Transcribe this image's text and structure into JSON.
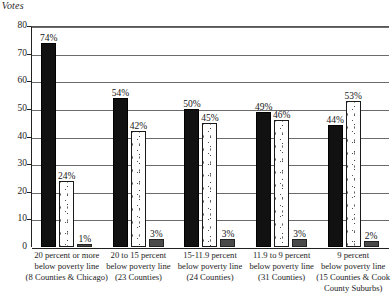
{
  "chart_data": {
    "type": "bar",
    "title": "f Votes",
    "xlabel": "",
    "ylabel": "f Votes",
    "ylim": [
      0,
      80
    ],
    "yticks": [
      0,
      10,
      20,
      30,
      40,
      50,
      60,
      70,
      80
    ],
    "grid": true,
    "legend": "none",
    "categories": [
      "20 percent or more below poverty line (8 Counties & Chicago)",
      "20 to 15 percent below poverty line (23 Counties)",
      "15-11.9 percent below poverty line (24 Counties)",
      "11.9 to 9 percent below poverty line (31 Counties)",
      "9 percent below poverty line (15 Counties & Cook County Suburbs)"
    ],
    "category_lines": [
      [
        "20 percent or more",
        "below poverty line",
        "(8 Counties & Chicago)"
      ],
      [
        "20 to 15 percent",
        "below poverty line",
        "(23 Counties)"
      ],
      [
        "15-11.9 percent",
        "below poverty line",
        "(24 Counties)"
      ],
      [
        "11.9 to 9 percent",
        "below poverty line",
        "(31 Counties)"
      ],
      [
        "9 percent",
        "below poverty line",
        "(15 Counties & Cook",
        "County Suburbs)"
      ]
    ],
    "series": [
      {
        "name": "series-1",
        "style": "solid-black",
        "color": "#111111",
        "values": [
          74,
          54,
          50,
          49,
          44
        ],
        "labels": [
          "74%",
          "54%",
          "50%",
          "49%",
          "44%"
        ]
      },
      {
        "name": "series-2",
        "style": "stippled-white",
        "color": "#ffffff",
        "values": [
          24,
          42,
          45,
          46,
          53
        ],
        "labels": [
          "24%",
          "42%",
          "45%",
          "46%",
          "53%"
        ]
      },
      {
        "name": "series-3",
        "style": "solid-gray",
        "color": "#4a4a4a",
        "values": [
          1,
          3,
          3,
          3,
          2
        ],
        "labels": [
          "1%",
          "3%",
          "3%",
          "3%",
          "2%"
        ]
      }
    ]
  }
}
